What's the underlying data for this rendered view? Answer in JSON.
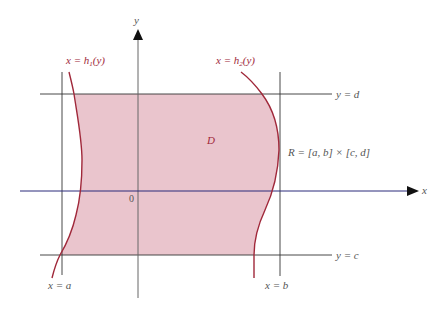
{
  "figure": {
    "type": "region-of-integration",
    "region_label": "D",
    "origin_label": "0",
    "axes": {
      "x_label": "x",
      "y_label": "y"
    },
    "curves": {
      "left": {
        "label_lhs": "x = h",
        "label_sub": "1",
        "label_rhs": "(y)"
      },
      "right": {
        "label_lhs": "x = h",
        "label_sub": "2",
        "label_rhs": "(y)"
      }
    },
    "lines": {
      "top": "y = d",
      "bottom": "y = c",
      "left": "x = a",
      "right": "x = b"
    },
    "rectangle_label": "R = [a, b] × [c, d]",
    "colors": {
      "region_fill": "#e8bfc8",
      "curve": "#a0283a",
      "x_axis": "#2b2b7a",
      "lines": "#333333",
      "text": "#555555"
    }
  }
}
